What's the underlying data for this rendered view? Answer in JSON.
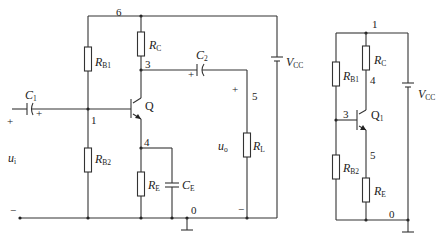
{
  "left_circuit": {
    "name": "Common-emitter amplifier with voltage-divider bias",
    "components": {
      "C1": {
        "main": "C",
        "sub": "1"
      },
      "C2": {
        "main": "C",
        "sub": "2"
      },
      "CE": {
        "main": "C",
        "sub": "E"
      },
      "RB1": {
        "main": "R",
        "sub": "B1"
      },
      "RB2": {
        "main": "R",
        "sub": "B2"
      },
      "RC": {
        "main": "R",
        "sub": "C"
      },
      "RE": {
        "main": "R",
        "sub": "E"
      },
      "RL": {
        "main": "R",
        "sub": "L"
      },
      "VCC": {
        "main": "V",
        "sub": "CC"
      },
      "Q": "Q"
    },
    "nodes": {
      "n0": "0",
      "n1": "1",
      "n3": "3",
      "n4": "4",
      "n5": "5",
      "n6": "6"
    },
    "ports": {
      "ui": {
        "main": "u",
        "sub": "i"
      },
      "uo": {
        "main": "u",
        "sub": "o"
      },
      "plus": "+",
      "minus": "−"
    }
  },
  "right_circuit": {
    "name": "DC equivalent circuit",
    "components": {
      "RB1": {
        "main": "R",
        "sub": "B1"
      },
      "RB2": {
        "main": "R",
        "sub": "B2"
      },
      "RC": {
        "main": "R",
        "sub": "C"
      },
      "RE": {
        "main": "R",
        "sub": "E"
      },
      "VCC": {
        "main": "V",
        "sub": "CC"
      },
      "Q1": {
        "main": "Q",
        "sub": "1"
      }
    },
    "nodes": {
      "n0": "0",
      "n1": "1",
      "n3": "3",
      "n4": "4",
      "n5": "5"
    }
  }
}
